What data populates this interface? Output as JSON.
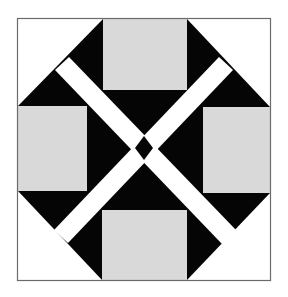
{
  "figure": {
    "colors": {
      "background": "#ffffff",
      "frame": "#6b6b6b",
      "black": "#050505",
      "gray": "#d9d9d9",
      "band": "#ffffff"
    },
    "frame": {
      "x": 17,
      "y": 18,
      "w": 253,
      "h": 263
    },
    "gray_squares": [
      {
        "name": "top",
        "x": 103,
        "y": 19,
        "w": 84,
        "h": 71
      },
      {
        "name": "left",
        "x": 18,
        "y": 106,
        "w": 69,
        "h": 85
      },
      {
        "name": "right",
        "x": 203,
        "y": 107,
        "w": 67,
        "h": 86
      },
      {
        "name": "bottom",
        "x": 102,
        "y": 210,
        "w": 85,
        "h": 70
      }
    ]
  }
}
